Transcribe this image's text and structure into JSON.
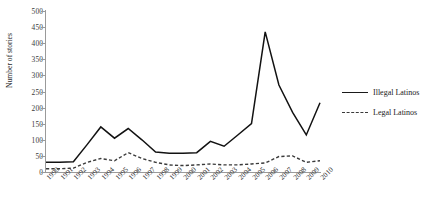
{
  "chart_data": {
    "type": "line",
    "title": "",
    "xlabel": "",
    "ylabel": "Number of stories",
    "ylim": [
      0,
      500
    ],
    "yticks": [
      0,
      50,
      100,
      150,
      200,
      250,
      300,
      350,
      400,
      450,
      500
    ],
    "grid": false,
    "legend_position": "right",
    "categories": [
      "1990",
      "1991",
      "1992",
      "1993",
      "1994",
      "1995",
      "1996",
      "1997",
      "1998",
      "1999",
      "2000",
      "2001",
      "2002",
      "2003",
      "2004",
      "2005",
      "2006",
      "2007",
      "2008",
      "2009",
      "2010"
    ],
    "series": [
      {
        "name": "Illegal Latinos",
        "style": "solid",
        "color": "#121212",
        "values": [
          30,
          30,
          32,
          85,
          140,
          105,
          135,
          100,
          62,
          58,
          58,
          60,
          95,
          80,
          115,
          150,
          435,
          270,
          185,
          115,
          215
        ]
      },
      {
        "name": "Legal Latinos",
        "style": "dashed",
        "color": "#3a3a3a",
        "values": [
          10,
          10,
          12,
          30,
          42,
          35,
          60,
          42,
          30,
          22,
          20,
          22,
          25,
          22,
          22,
          25,
          28,
          48,
          50,
          30,
          35
        ]
      }
    ]
  },
  "legend": {
    "items": [
      {
        "label": "Illegal Latinos",
        "style": "solid"
      },
      {
        "label": "Legal Latinos",
        "style": "dashed"
      }
    ]
  }
}
